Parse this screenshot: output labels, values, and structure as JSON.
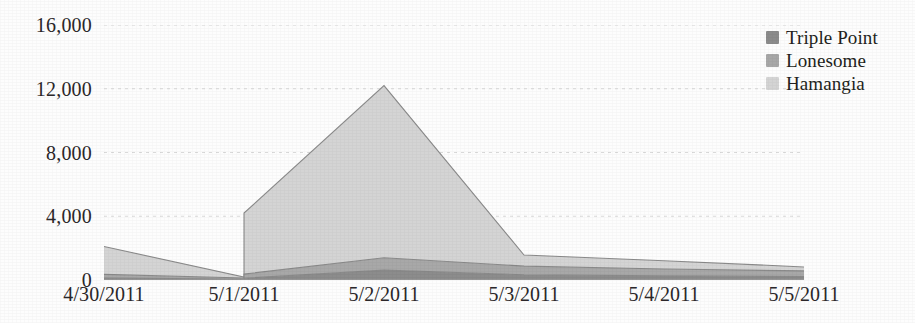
{
  "chart_data": {
    "type": "area",
    "stacked": true,
    "title": "",
    "subtitle": "",
    "xlabel": "",
    "ylabel": "",
    "categories": [
      "4/30/2011",
      "5/1/2011",
      "5/2/2011",
      "5/3/2011",
      "5/4/2011",
      "5/5/2011"
    ],
    "x_tick_labels": [
      "4/30/2011",
      "5/1/2011",
      "5/2/2011",
      "5/3/2011",
      "5/4/2011",
      "5/5/2011"
    ],
    "y_tick_labels": [
      "16,000",
      "12,000",
      "8,000",
      "4,000",
      "0"
    ],
    "y_tick_values": [
      16000,
      12000,
      8000,
      4000,
      0
    ],
    "ylim": [
      0,
      16000
    ],
    "grid": true,
    "grid_axis": "y",
    "legend_position": "top-right",
    "series": [
      {
        "name": "Triple Point",
        "color": "#8c8c8c",
        "values": [
          120,
          60,
          620,
          330,
          260,
          210
        ]
      },
      {
        "name": "Lonesome",
        "color": "#a8a8a8",
        "values": [
          230,
          70,
          780,
          540,
          430,
          360
        ]
      },
      {
        "name": "Hamangia",
        "color": "#d4d4d4",
        "values": [
          1750,
          60,
          10800,
          700,
          520,
          250
        ]
      }
    ],
    "step_events": [
      {
        "at": "5/1/2011",
        "note": "vertical jump in stacked total",
        "total_before": 190,
        "total_after": 4200,
        "after_breakdown": {
          "Triple Point": 110,
          "Lonesome": 260,
          "Hamangia": 3830
        }
      },
      {
        "at": "5/2/2011",
        "note": "vertical spike in stacked total",
        "total_before": 2200,
        "total_after": 12200,
        "after_breakdown": {
          "Triple Point": 620,
          "Lonesome": 780,
          "Hamangia": 10800
        }
      }
    ],
    "stacked_totals": [
      2100,
      190,
      12200,
      1570,
      1210,
      820
    ]
  },
  "legend": {
    "items": [
      {
        "label": "Triple Point",
        "color": "#8c8c8c"
      },
      {
        "label": "Lonesome",
        "color": "#a8a8a8"
      },
      {
        "label": "Hamangia",
        "color": "#d4d4d4"
      }
    ]
  },
  "axes": {
    "y": {
      "ticks": [
        {
          "label": "16,000",
          "value": 16000
        },
        {
          "label": "12,000",
          "value": 12000
        },
        {
          "label": "8,000",
          "value": 8000
        },
        {
          "label": "4,000",
          "value": 4000
        },
        {
          "label": "0",
          "value": 0
        }
      ]
    },
    "x": {
      "ticks": [
        {
          "label": "4/30/2011"
        },
        {
          "label": "5/1/2011"
        },
        {
          "label": "5/2/2011"
        },
        {
          "label": "5/3/2011"
        },
        {
          "label": "5/4/2011"
        },
        {
          "label": "5/5/2011"
        }
      ]
    }
  },
  "colors": {
    "background": "#ffffff",
    "text": "#231f20",
    "gridline": "#d9d9d9",
    "baseline": "#a0a0a0"
  }
}
